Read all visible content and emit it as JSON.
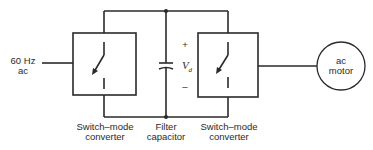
{
  "diagram": {
    "source_label": {
      "line1": "60 Hz",
      "line2": "ac"
    },
    "converter_left": {
      "line1": "Switch–mode",
      "line2": "converter"
    },
    "filter": {
      "line1": "Filter",
      "line2": "capacitor"
    },
    "converter_right": {
      "line1": "Switch–mode",
      "line2": "converter"
    },
    "voltage": {
      "symbol": "V",
      "subscript": "d",
      "plus": "+",
      "minus": "–"
    },
    "motor": {
      "line1": "ac",
      "line2": "motor"
    },
    "colors": {
      "line": "#2a2a2a",
      "background": "#ffffff"
    }
  }
}
